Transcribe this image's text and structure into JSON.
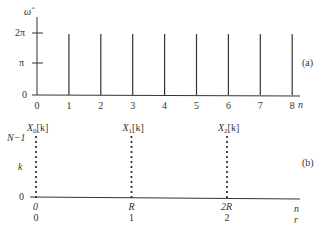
{
  "panel_a": {
    "label": "(a)",
    "y_axis_label": "ω̂",
    "x_axis_label": "n",
    "y_ticks": [
      {
        "label": "0",
        "value": 0
      },
      {
        "label": "π",
        "value": 1
      },
      {
        "label": "2π",
        "value": 2
      }
    ],
    "x_ticks": [
      "0",
      "1",
      "2",
      "3",
      "4",
      "5",
      "6",
      "7",
      "8"
    ],
    "impulse_positions": [
      1,
      2,
      3,
      4,
      5,
      6,
      7,
      8
    ],
    "impulse_height": 2
  },
  "panel_b": {
    "label": "(b)",
    "y_axis_label": "k",
    "y_top_label": "N−1",
    "y_zero_label": "0",
    "x_axis_label": "n",
    "x_axis_label2": "r",
    "columns": [
      {
        "title": "X",
        "sub": "0",
        "suffix": "[k]",
        "n_label": "0",
        "r_label": "0",
        "index": 0
      },
      {
        "title": "X",
        "sub": "1",
        "suffix": "[k]",
        "n_label": "R",
        "r_label": "1",
        "index": 1
      },
      {
        "title": "X",
        "sub": "2",
        "suffix": "[k]",
        "n_label": "2R",
        "r_label": "2",
        "index": 2
      }
    ],
    "dots_per_column": 13
  }
}
